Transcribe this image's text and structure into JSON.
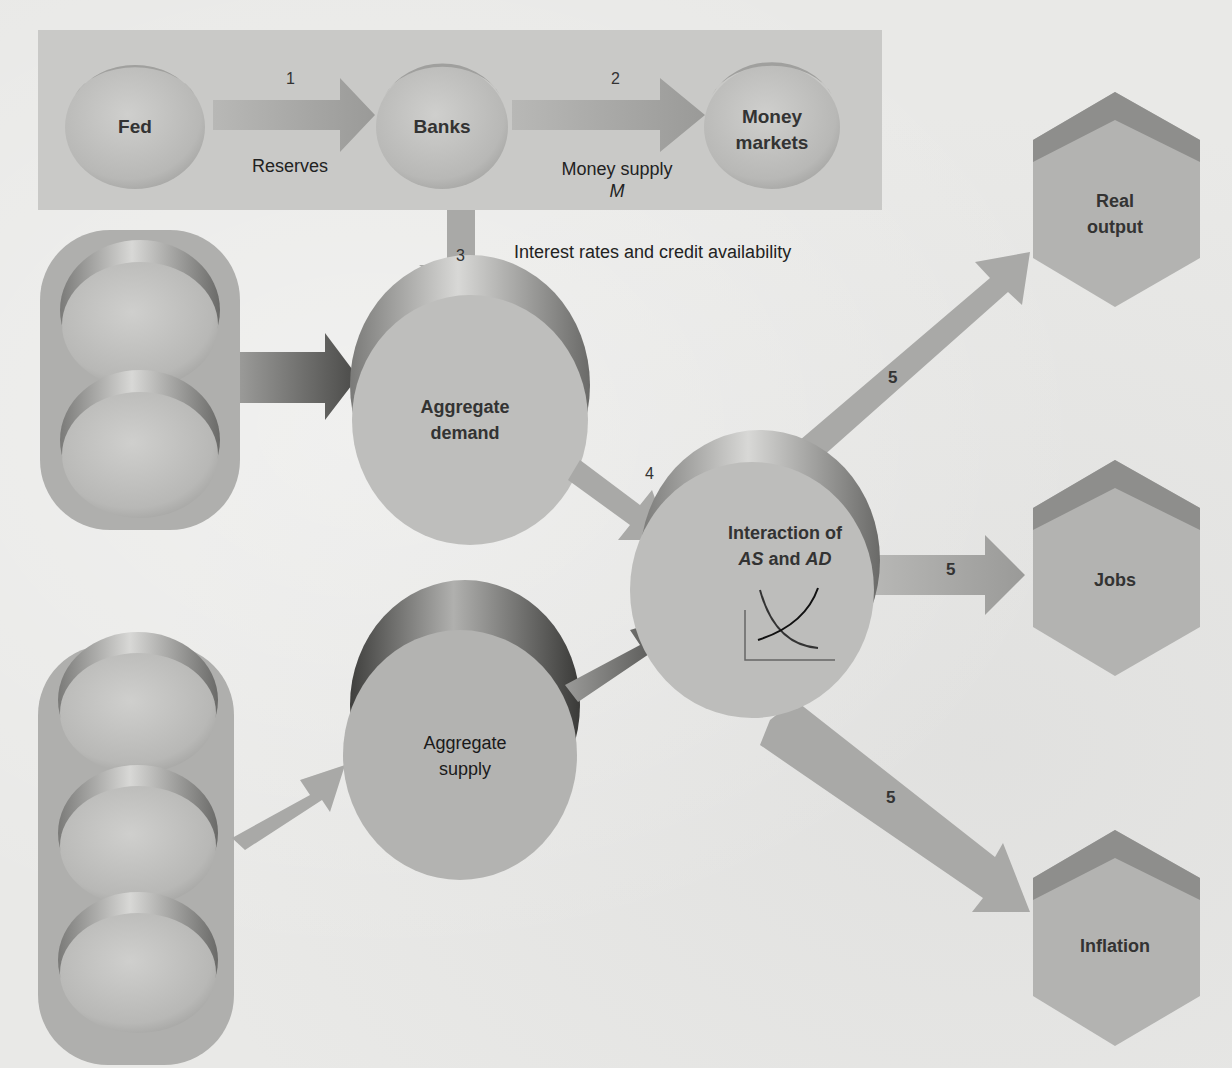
{
  "diagram": {
    "top_panel": {
      "nodes": [
        {
          "id": "fed",
          "label": "Fed"
        },
        {
          "id": "banks",
          "label": "Banks"
        },
        {
          "id": "money_markets",
          "label_line1": "Money",
          "label_line2": "markets"
        }
      ],
      "arrows": [
        {
          "step": "1",
          "label": "Reserves"
        },
        {
          "step": "2",
          "label_line1": "Money supply",
          "label_line2": "M"
        }
      ]
    },
    "step3": {
      "step": "3",
      "label": "Interest rates and credit availability"
    },
    "aggregate_demand": {
      "label_line1": "Aggregate",
      "label_line2": "demand"
    },
    "aggregate_supply": {
      "label_line1": "Aggregate",
      "label_line2": "supply"
    },
    "step4": {
      "step": "4"
    },
    "interaction": {
      "label_line1": "Interaction of",
      "label_as": "AS",
      "label_and": "and",
      "label_ad": "AD"
    },
    "outcomes": [
      {
        "step": "5",
        "label_line1": "Real",
        "label_line2": "output"
      },
      {
        "step": "5",
        "label": "Jobs"
      },
      {
        "step": "5",
        "label": "Inflation"
      }
    ],
    "colors": {
      "background": "#e9e9e7",
      "panel": "#c9c9c7",
      "node_fill": "#bdbdbb",
      "arrow": "#a9a9a7",
      "dark_shadow": "#6e6e6c",
      "text": "#222222"
    }
  }
}
